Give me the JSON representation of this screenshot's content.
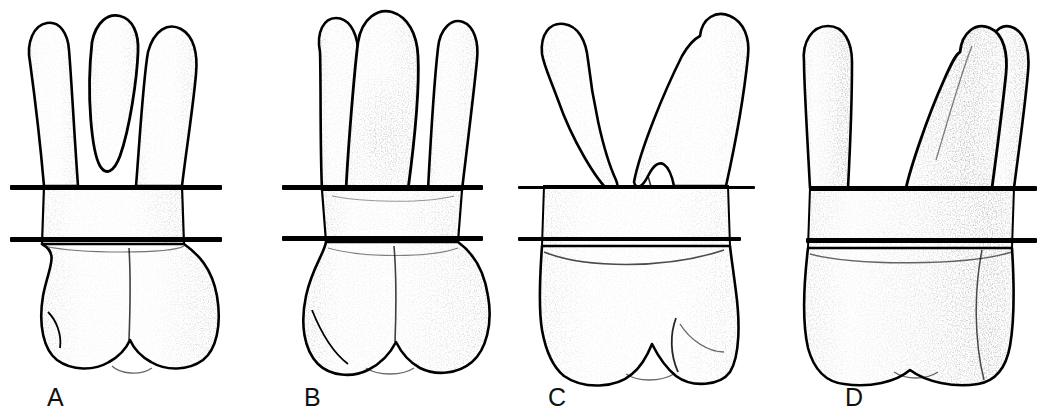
{
  "figure": {
    "type": "anatomical-line-drawing",
    "background_color": "#ffffff",
    "ink_color": "#000000",
    "width": 1047,
    "height": 413,
    "technique": "stipple-and-outline pen drawing",
    "panel_count": 4
  },
  "panels": [
    {
      "label": "A",
      "label_x": 47,
      "label_y": 385,
      "panel_x": 0,
      "panel_width": 262,
      "view": "mesial-root-trifurcation view",
      "root_count": 3,
      "crown_cusps": 2,
      "reference_lines": {
        "upper": {
          "x": 10,
          "y": 185,
          "width": 212,
          "height": 5
        },
        "lower": {
          "x": 10,
          "y": 237,
          "width": 212,
          "height": 5
        }
      }
    },
    {
      "label": "B",
      "label_x": 304,
      "label_y": 385,
      "panel_x": 262,
      "panel_width": 262,
      "view": "palatal view",
      "root_count": 3,
      "crown_cusps": 2,
      "reference_lines": {
        "upper": {
          "x": 282,
          "y": 185,
          "width": 201,
          "height": 5
        },
        "lower": {
          "x": 282,
          "y": 236,
          "width": 201,
          "height": 5
        }
      }
    },
    {
      "label": "C",
      "label_x": 548,
      "label_y": 385,
      "panel_x": 524,
      "panel_width": 262,
      "view": "buccal view",
      "root_count": 2,
      "crown_cusps": 2,
      "reference_lines": {
        "upper": {
          "x": 518,
          "y": 186,
          "width": 237,
          "height": 4
        },
        "lower": {
          "x": 518,
          "y": 237,
          "width": 223,
          "height": 4
        }
      }
    },
    {
      "label": "D",
      "label_x": 845,
      "label_y": 385,
      "panel_x": 786,
      "panel_width": 261,
      "view": "distal view",
      "root_count": 3,
      "crown_cusps": 1,
      "reference_lines": {
        "upper": {
          "x": 810,
          "y": 186,
          "width": 227,
          "height": 5
        },
        "lower": {
          "x": 806,
          "y": 238,
          "width": 231,
          "height": 5
        }
      }
    }
  ]
}
